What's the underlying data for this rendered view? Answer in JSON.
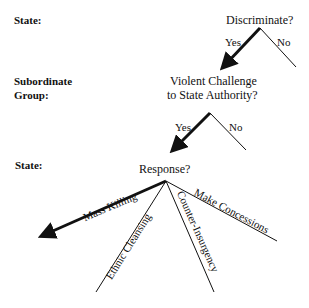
{
  "actors": {
    "state_1": "State:",
    "subordinate_line1": "Subordinate",
    "subordinate_line2": "Group:",
    "state_2": "State:"
  },
  "nodes": {
    "discriminate": "Discriminate?",
    "challenge_line1": "Violent Challenge",
    "challenge_line2": "to State Authority?",
    "response": "Response?"
  },
  "branches": {
    "discriminate_yes": "Yes",
    "discriminate_no": "No",
    "challenge_yes": "Yes",
    "challenge_no": "No",
    "mass_killing": "Mass Killing",
    "ethnic_cleansing": "Ethnic Cleansing",
    "counter_insurgency": "Counter-Insurgency",
    "make_concessions": "Make Concessions"
  },
  "colors": {
    "line": "#111111",
    "background": "#ffffff"
  }
}
